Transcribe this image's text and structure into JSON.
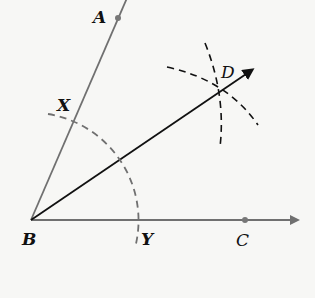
{
  "diagram": {
    "type": "angle-bisector-construction",
    "colors": {
      "background": "#f7f7f5",
      "ray_gray": "#707070",
      "bisector": "#111111",
      "arc_dash_gray": "#707070",
      "arc_dash_black": "#111111"
    },
    "points": {
      "A": {
        "label": "A",
        "x": 118,
        "y": 18
      },
      "B": {
        "label": "B",
        "x": 31,
        "y": 220
      },
      "C": {
        "label": "C",
        "x": 245,
        "y": 220
      },
      "D": {
        "label": "D",
        "x": 221,
        "y": 89
      },
      "X": {
        "label": "X",
        "x": 54,
        "y": 122
      },
      "Y": {
        "label": "Y",
        "x": 136,
        "y": 220
      }
    },
    "rays": [
      {
        "name": "BA",
        "from": "B",
        "through": "A",
        "color": "gray"
      },
      {
        "name": "BC",
        "from": "B",
        "through": "C",
        "color": "gray",
        "arrow": true
      },
      {
        "name": "BD",
        "from": "B",
        "through": "D",
        "color": "black",
        "arrow": true
      }
    ],
    "arcs": [
      {
        "name": "arc-XY",
        "center": "B",
        "style": "dashed gray"
      },
      {
        "name": "arc-from-X",
        "center": "X",
        "style": "dashed black"
      },
      {
        "name": "arc-from-Y",
        "center": "Y",
        "style": "dashed black"
      }
    ]
  }
}
